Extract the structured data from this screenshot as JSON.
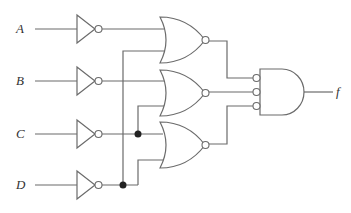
{
  "diagram": {
    "type": "logic-circuit",
    "inputs": [
      {
        "name": "A",
        "y": 29
      },
      {
        "name": "B",
        "y": 81
      },
      {
        "name": "C",
        "y": 134
      },
      {
        "name": "D",
        "y": 185
      }
    ],
    "output": {
      "name": "f"
    },
    "gates": [
      {
        "id": "not-a",
        "type": "NOT",
        "input": "A"
      },
      {
        "id": "not-b",
        "type": "NOT",
        "input": "B"
      },
      {
        "id": "not-c",
        "type": "NOT",
        "input": "C"
      },
      {
        "id": "not-d",
        "type": "NOT",
        "input": "D"
      },
      {
        "id": "nor-1",
        "type": "NOR",
        "inputs": [
          "A'",
          "D'"
        ]
      },
      {
        "id": "nor-2",
        "type": "NOR",
        "inputs": [
          "B'",
          "C'"
        ]
      },
      {
        "id": "nor-3",
        "type": "NOR",
        "inputs": [
          "C'",
          "D'"
        ]
      },
      {
        "id": "and-out",
        "type": "AND",
        "inputs_inverted": [
          true,
          true,
          true
        ],
        "inputs": [
          "nor-1",
          "nor-2",
          "nor-3"
        ],
        "output": "f"
      }
    ],
    "colors": {
      "line": "#6b6b6b",
      "junction": "#222222",
      "background": "#ffffff"
    }
  }
}
